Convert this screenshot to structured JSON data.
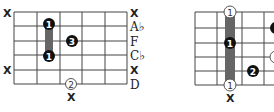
{
  "left_diagram": {
    "strings": 6,
    "frets": 5,
    "muted_left": [
      "X",
      "X"
    ],
    "muted_right": [
      "X",
      "X"
    ],
    "right_labels": [
      "A♭",
      "F",
      "C♭",
      "D"
    ],
    "bottom_mark": "X",
    "fingers": [
      {
        "label": "1",
        "style": "filled"
      },
      {
        "label": "3",
        "style": "filled"
      },
      {
        "label": "1",
        "style": "filled"
      },
      {
        "label": "2",
        "style": "open"
      }
    ],
    "barre": true
  },
  "right_diagram": {
    "strings": 6,
    "frets": 5,
    "bottom_mark": "X",
    "fingers": [
      {
        "label": "1",
        "style": "open"
      },
      {
        "label": "1",
        "style": "filled"
      },
      {
        "label": "2",
        "style": "filled"
      },
      {
        "label": "1",
        "style": "open"
      },
      {
        "label": "4",
        "style": "filled"
      },
      {
        "label": "",
        "style": "open"
      }
    ],
    "barre": true
  }
}
